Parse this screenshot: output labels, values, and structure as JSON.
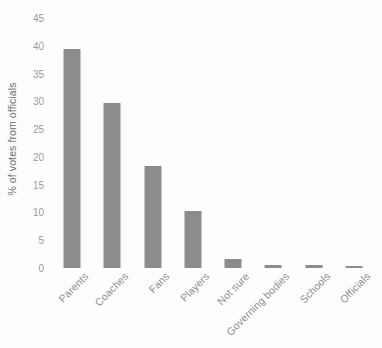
{
  "chart_data": {
    "type": "bar",
    "title": "",
    "subtitle": "",
    "xlabel": "",
    "ylabel": "% of votes from officials",
    "categories": [
      "Parents",
      "Coaches",
      "Fans",
      "Players",
      "Not sure",
      "Governing bodies",
      "Schools",
      "Officials"
    ],
    "values": [
      39.5,
      29.7,
      18.4,
      10.3,
      1.6,
      0.6,
      0.5,
      0.4
    ],
    "series": [
      {
        "name": "% of votes from officials",
        "values": [
          39.5,
          29.7,
          18.4,
          10.3,
          1.6,
          0.6,
          0.5,
          0.4
        ]
      }
    ],
    "ylim": [
      0,
      45
    ],
    "ytick_labels": [
      "45",
      "40",
      "35",
      "30",
      "25",
      "20",
      "15",
      "10",
      "5",
      "0"
    ],
    "ytick_values": [
      45,
      40,
      35,
      30,
      25,
      20,
      15,
      10,
      5,
      0
    ],
    "ytick_step": 5,
    "grid": false,
    "legend": false,
    "legend_position": "none",
    "bar_color": "#8c8c8c",
    "background_color": "#fdfdfd",
    "axis_text_color": "#9a9a9a",
    "axis_title_color": "#6e6e6e",
    "xtick_rotation_deg": -45
  }
}
